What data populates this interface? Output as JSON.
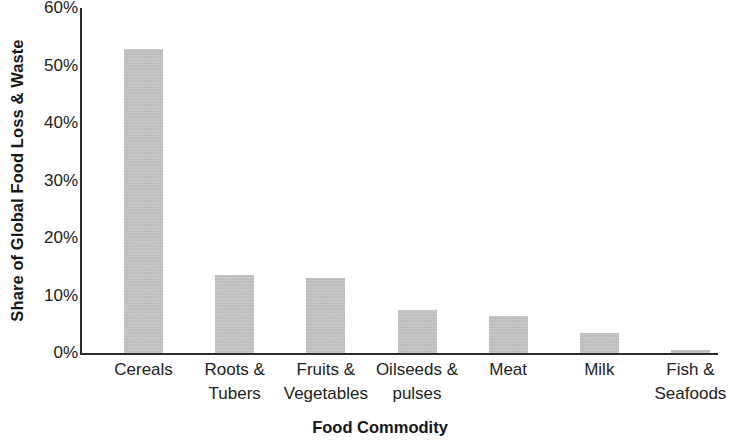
{
  "chart_data": {
    "type": "bar",
    "title": "",
    "xlabel": "Food Commodity",
    "ylabel": "Share of Global Food Loss & Waste",
    "categories": [
      "Cereals",
      "Roots & Tubers",
      "Fruits & Vegetables",
      "Oilseeds & pulses",
      "Meat",
      "Milk",
      "Fish & Seafoods"
    ],
    "category_lines": [
      [
        "Cereals",
        ""
      ],
      [
        "Roots &",
        "Tubers"
      ],
      [
        "Fruits &",
        "Vegetables"
      ],
      [
        "Oilseeds &",
        "pulses"
      ],
      [
        "Meat",
        ""
      ],
      [
        "Milk",
        ""
      ],
      [
        "Fish &",
        "Seafoods"
      ]
    ],
    "values": [
      52.9,
      13.5,
      13.1,
      7.5,
      6.5,
      3.4,
      0.6
    ],
    "value_labels": [
      "52.9%",
      "13.5%",
      "13.1%",
      "7.5%",
      "6.5%",
      "3.4%",
      "0.6%"
    ],
    "ylim": [
      0,
      60
    ],
    "ytick_values": [
      60,
      50,
      40,
      30,
      20,
      10,
      0
    ],
    "ytick_labels": [
      "60%",
      "50%",
      "40%",
      "30%",
      "20%",
      "10%",
      "0%"
    ],
    "grid": false,
    "legend": false,
    "legend_position": "none",
    "bar_color": "#bfbfbf",
    "axis_color": "#2b2b2b",
    "text_color": "#222222"
  }
}
